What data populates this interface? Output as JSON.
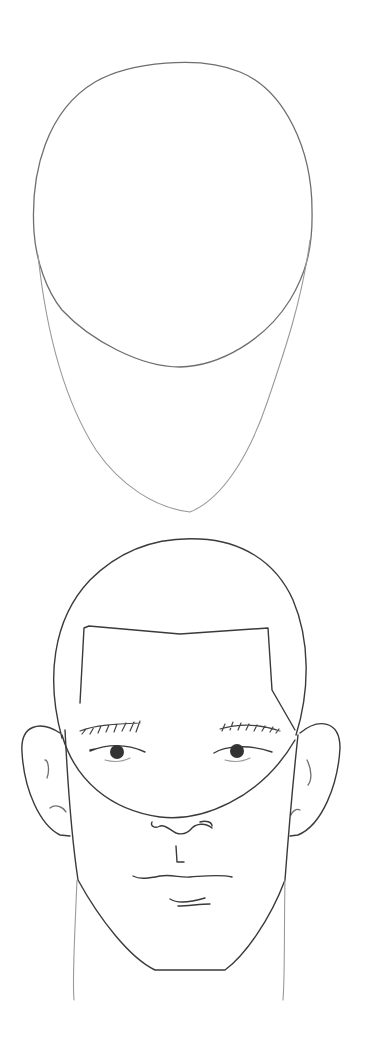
{
  "image": {
    "description": "Pencil sketch drawing tutorial showing two steps of drawing a male head from the front",
    "background": "#ffffff",
    "stroke_colors": {
      "light": "#9a9a9a",
      "mid": "#6e6e6e",
      "dark": "#3a3a3a"
    },
    "steps": [
      {
        "label": "step-1-construction",
        "elements": [
          "cranium-circle",
          "jaw-outline"
        ]
      },
      {
        "label": "step-2-face",
        "elements": [
          "head-outline",
          "hairline",
          "eyebrows",
          "eyes",
          "ears",
          "nose",
          "mouth",
          "chin",
          "neck"
        ]
      }
    ]
  }
}
